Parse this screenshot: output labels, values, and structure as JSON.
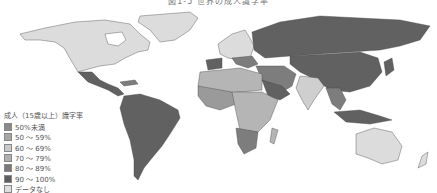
{
  "title": "図1-5 世界の成人識字率",
  "legend": {
    "title": "成人（15歳以上）識字率",
    "items": [
      {
        "label": "50%未満",
        "color": "#8a8a8a"
      },
      {
        "label": "50 ～ 59%",
        "color": "#a6a6a6"
      },
      {
        "label": "60 ～ 69%",
        "color": "#c9c9c9"
      },
      {
        "label": "70 ～ 79%",
        "color": "#b0b0b0"
      },
      {
        "label": "80 ～ 89%",
        "color": "#7a7a7a"
      },
      {
        "label": "90 ～ 100%",
        "color": "#5e5e5e"
      },
      {
        "label": "データなし",
        "color": "#dedede"
      }
    ]
  },
  "colors": {
    "no_data": "#dcdcdc",
    "high": "#616161",
    "mid_high": "#7d7d7d",
    "mid": "#9a9a9a",
    "low_mid": "#b5b5b5",
    "low": "#cfcfcf"
  }
}
